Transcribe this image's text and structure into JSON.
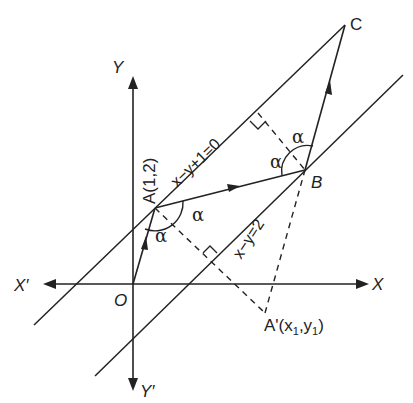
{
  "diagram": {
    "colors": {
      "stroke": "#222222",
      "background": "#ffffff"
    },
    "axes": {
      "x_label": "X",
      "x_neg_label": "X′",
      "y_label": "Y",
      "y_neg_label": "Y′",
      "origin_label": "O"
    },
    "points": {
      "A": {
        "label": "A(1,2)"
      },
      "B": {
        "label": "B"
      },
      "C": {
        "label": "C"
      },
      "A_prime": {
        "label": "A'(x",
        "sub1": "1",
        "mid": ",y",
        "sub2": "1",
        "end": ")"
      }
    },
    "lines": {
      "upper": {
        "equation": "x−y+1=0"
      },
      "lower": {
        "equation": "x−y=2"
      }
    },
    "angles": {
      "at_A_left": "α",
      "at_A_right": "α",
      "at_B_left": "α",
      "at_B_top": "α"
    }
  }
}
